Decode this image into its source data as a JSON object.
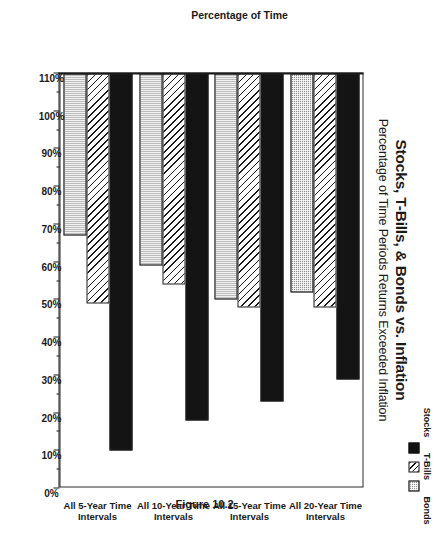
{
  "chart_data": {
    "type": "bar",
    "orientation": "vertical-grouped",
    "title": "Stocks, T-Bills, & Bonds vs. Inflation",
    "subtitle": "Percentage of Time Periods Returns Exceeded Inflation",
    "figure_caption": "Figure 10.2",
    "xlabel": "",
    "ylabel": "Percentage of Time",
    "ylim": [
      0,
      110
    ],
    "ytick_step": 10,
    "grid": false,
    "legend_position": "top-right",
    "categories": [
      "All 5-Year Time Intervals",
      "All 10-Year Time Intervals",
      "All 15-Year Time Intervals",
      "All 20-Year Time Intervals"
    ],
    "tick_labels": [
      "110%",
      "100%",
      "90%",
      "80%",
      "70%",
      "60%",
      "50%",
      "40%",
      "30%",
      "20%",
      "10%",
      "0%"
    ],
    "tick_values": [
      110,
      100,
      90,
      80,
      70,
      60,
      50,
      40,
      30,
      20,
      10,
      0
    ],
    "series": [
      {
        "name": "Stocks",
        "values": [
          81,
          87,
          92,
          100
        ],
        "fill": "solid-black",
        "color": "#141414"
      },
      {
        "name": "T-Bills",
        "values": [
          62,
          62,
          56,
          61
        ],
        "fill": "diagonal-hatch",
        "color": "#ffffff"
      },
      {
        "name": "Bonds",
        "values": [
          58,
          60,
          51,
          43
        ],
        "fill": "gray-crosshatch",
        "color": "#8f8f8f"
      }
    ]
  },
  "legend": {
    "entries": [
      {
        "label": "Stocks",
        "swatch": "solid-black-swatch"
      },
      {
        "label": "T-Bills",
        "swatch": "hatched-swatch"
      },
      {
        "label": "Bonds",
        "swatch": "gray-crosshatch-swatch"
      }
    ]
  },
  "axis": {
    "value_axis_title": "Percentage of Time",
    "value_axis_max": 110,
    "value_axis_min": 0
  }
}
